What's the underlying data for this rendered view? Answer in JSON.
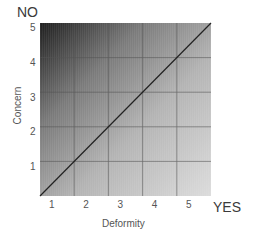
{
  "chart_data": {
    "type": "heatmap",
    "title": "",
    "xlabel": "Deformity",
    "ylabel": "Concern",
    "x_ticks": [
      "1",
      "2",
      "3",
      "4",
      "5"
    ],
    "y_ticks": [
      "1",
      "2",
      "3",
      "4",
      "5"
    ],
    "xlim": [
      0.5,
      5.5
    ],
    "ylim": [
      0.5,
      5.5
    ],
    "grid": true,
    "corner_labels": {
      "top_left": "NO",
      "bottom_right": "YES"
    },
    "gradient": {
      "dark_corner": "top-left",
      "light_corner": "bottom-right",
      "dark_color": "#1a1a1a",
      "light_color": "#d8d8d8"
    },
    "reference_line": {
      "from": [
        0.5,
        0.5
      ],
      "to": [
        5.5,
        5.5
      ],
      "color": "#222222"
    }
  },
  "labels": {
    "no": "NO",
    "yes": "YES",
    "xlabel": "Deformity",
    "ylabel": "Concern"
  }
}
